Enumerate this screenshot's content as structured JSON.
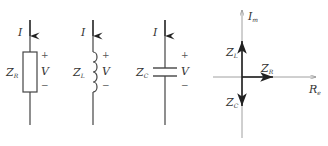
{
  "diagram": {
    "elements": [
      {
        "id": "resistor",
        "current_label": "I",
        "impedance_label": "Z",
        "impedance_sub": "R",
        "voltage_label": "V",
        "plus": "+",
        "minus": "−"
      },
      {
        "id": "inductor",
        "current_label": "I",
        "impedance_label": "Z",
        "impedance_sub": "L",
        "voltage_label": "V",
        "plus": "+",
        "minus": "−"
      },
      {
        "id": "capacitor",
        "current_label": "I",
        "impedance_label": "Z",
        "impedance_sub": "C",
        "voltage_label": "V",
        "plus": "+",
        "minus": "−"
      }
    ],
    "phasor": {
      "imag_axis_label": "I",
      "imag_axis_sub": "m",
      "real_axis_label": "R",
      "real_axis_sub": "e",
      "vectors": [
        {
          "label": "Z",
          "sub": "L",
          "direction": "up"
        },
        {
          "label": "Z",
          "sub": "R",
          "direction": "right"
        },
        {
          "label": "Z",
          "sub": "C",
          "direction": "down"
        }
      ]
    }
  },
  "colors": {
    "line": "#444444",
    "vector": "#222222",
    "axis": "#888888"
  }
}
